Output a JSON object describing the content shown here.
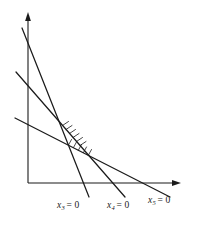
{
  "figure": {
    "background_color": "#ffffff",
    "ink_color": "#1b1b1b",
    "width": 201,
    "height": 228
  },
  "axes": {
    "origin": {
      "x": 28,
      "y": 183
    },
    "y_axis": {
      "label": "",
      "from": {
        "x": 28,
        "y": 183
      },
      "to": {
        "x": 28,
        "y": 14
      },
      "arrow": "up"
    },
    "x_axis": {
      "label": "",
      "from": {
        "x": 28,
        "y": 183
      },
      "to": {
        "x": 181,
        "y": 183
      },
      "arrow": "right"
    }
  },
  "lines": [
    {
      "id": "x3",
      "label_text": "x",
      "label_sub": "3",
      "label_eq": "= 0",
      "slope_description": "steepest descending line",
      "from": {
        "x": 22,
        "y": 28
      },
      "to": {
        "x": 89,
        "y": 197
      }
    },
    {
      "id": "x4",
      "label_text": "x",
      "label_sub": "4",
      "label_eq": "= 0",
      "slope_description": "medium descending line",
      "from": {
        "x": 16,
        "y": 72
      },
      "to": {
        "x": 125,
        "y": 197
      }
    },
    {
      "id": "x5",
      "label_text": "x",
      "label_sub": "5",
      "label_eq": "= 0",
      "slope_description": "shallow descending line",
      "from": {
        "x": 15,
        "y": 118
      },
      "to": {
        "x": 170,
        "y": 197
      }
    }
  ],
  "hatching": [
    {
      "id": "hatch-x3",
      "on_line": "x3",
      "description": "tick marks on feasible side of x3 = 0 between vertices"
    },
    {
      "id": "hatch-x5",
      "on_line": "x5",
      "description": "tick marks on feasible side of x5 = 0 between vertices"
    }
  ],
  "labels": {
    "x3": {
      "text": "x",
      "sub": "3",
      "eq": "= 0"
    },
    "x4": {
      "text": "x",
      "sub": "4",
      "eq": "= 0"
    },
    "x5": {
      "text": "x",
      "sub": "5",
      "eq": "= 0"
    }
  }
}
